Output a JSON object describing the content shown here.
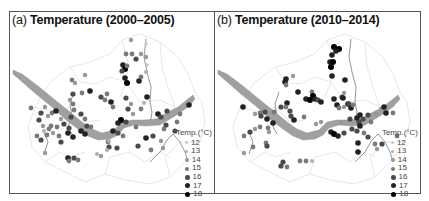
{
  "figure": {
    "panels": [
      {
        "id": "a",
        "tag": "(a)",
        "title": "Temperature (2000–2005)",
        "legend_title": "Temp.(°C)"
      },
      {
        "id": "b",
        "tag": "(b)",
        "title": "Temperature (2010–2014)",
        "legend_title": "Temp.(°C)"
      }
    ],
    "legend_levels": [
      {
        "label": "12",
        "color": "#c8c8c8",
        "size": 3
      },
      {
        "label": "13",
        "color": "#b0b0b0",
        "size": 3.4
      },
      {
        "label": "14",
        "color": "#989898",
        "size": 3.8
      },
      {
        "label": "15",
        "color": "#7a7a7a",
        "size": 4.2
      },
      {
        "label": "16",
        "color": "#4a4a4a",
        "size": 4.6
      },
      {
        "label": "17",
        "color": "#222222",
        "size": 5
      },
      {
        "label": "18",
        "color": "#000000",
        "size": 5.4
      }
    ]
  },
  "chart_data": [
    {
      "type": "scatter",
      "title": "(a) Temperature (2000–2005)",
      "legend": {
        "title": "Temp.(°C)",
        "entries": [
          "12",
          "13",
          "14",
          "15",
          "16",
          "17",
          "18"
        ],
        "position": "bottom-right"
      },
      "points": [
        [
          130,
          39,
          14
        ],
        [
          145,
          43,
          12
        ],
        [
          125,
          53,
          15
        ],
        [
          131,
          53,
          15
        ],
        [
          135,
          58,
          16
        ],
        [
          140,
          53,
          14
        ],
        [
          145,
          56,
          14
        ],
        [
          146,
          64,
          12
        ],
        [
          122,
          64,
          17
        ],
        [
          124,
          68,
          18
        ],
        [
          121,
          70,
          16
        ],
        [
          126,
          65,
          15
        ],
        [
          124,
          77,
          17
        ],
        [
          126,
          82,
          18
        ],
        [
          138,
          80,
          17
        ],
        [
          140,
          76,
          15
        ],
        [
          145,
          71,
          13
        ],
        [
          71,
          79,
          15
        ],
        [
          74,
          82,
          14
        ],
        [
          84,
          74,
          14
        ],
        [
          72,
          93,
          16
        ],
        [
          81,
          92,
          15
        ],
        [
          89,
          90,
          17
        ],
        [
          72,
          103,
          15
        ],
        [
          69,
          99,
          14
        ],
        [
          73,
          109,
          15
        ],
        [
          100,
          96,
          16
        ],
        [
          104,
          99,
          15
        ],
        [
          106,
          93,
          15
        ],
        [
          110,
          101,
          17
        ],
        [
          112,
          106,
          15
        ],
        [
          125,
          97,
          16
        ],
        [
          127,
          108,
          16
        ],
        [
          130,
          103,
          14
        ],
        [
          140,
          108,
          15
        ],
        [
          146,
          96,
          17
        ],
        [
          143,
          102,
          13
        ],
        [
          132,
          113,
          14
        ],
        [
          157,
          113,
          17
        ],
        [
          160,
          116,
          16
        ],
        [
          166,
          110,
          16
        ],
        [
          179,
          113,
          15
        ],
        [
          188,
          104,
          17
        ],
        [
          30,
          107,
          15
        ],
        [
          40,
          112,
          16
        ],
        [
          44,
          106,
          14
        ],
        [
          47,
          115,
          14
        ],
        [
          51,
          112,
          15
        ],
        [
          55,
          110,
          17
        ],
        [
          60,
          118,
          14
        ],
        [
          38,
          119,
          16
        ],
        [
          42,
          125,
          14
        ],
        [
          50,
          125,
          15
        ],
        [
          56,
          126,
          15
        ],
        [
          63,
          123,
          16
        ],
        [
          70,
          116,
          16
        ],
        [
          80,
          113,
          16
        ],
        [
          84,
          118,
          15
        ],
        [
          120,
          119,
          18
        ],
        [
          117,
          122,
          17
        ],
        [
          125,
          121,
          16
        ],
        [
          135,
          126,
          15
        ],
        [
          112,
          130,
          17
        ],
        [
          122,
          135,
          15
        ],
        [
          117,
          132,
          16
        ],
        [
          43,
          130,
          13
        ],
        [
          46,
          134,
          15
        ],
        [
          52,
          132,
          14
        ],
        [
          40,
          139,
          16
        ],
        [
          36,
          135,
          15
        ],
        [
          48,
          128,
          15
        ],
        [
          58,
          135,
          15
        ],
        [
          60,
          141,
          16
        ],
        [
          67,
          132,
          17
        ],
        [
          68,
          127,
          16
        ],
        [
          72,
          136,
          17
        ],
        [
          80,
          130,
          17
        ],
        [
          86,
          125,
          16
        ],
        [
          90,
          126,
          15
        ],
        [
          84,
          133,
          17
        ],
        [
          107,
          141,
          15
        ],
        [
          108,
          146,
          16
        ],
        [
          108,
          140,
          13
        ],
        [
          116,
          147,
          16
        ],
        [
          137,
          145,
          16
        ],
        [
          145,
          137,
          17
        ],
        [
          152,
          135,
          16
        ],
        [
          160,
          140,
          14
        ],
        [
          163,
          128,
          15
        ],
        [
          174,
          130,
          16
        ],
        [
          165,
          124,
          16
        ],
        [
          176,
          121,
          15
        ],
        [
          162,
          147,
          14
        ],
        [
          150,
          149,
          15
        ],
        [
          44,
          152,
          14
        ],
        [
          67,
          157,
          17
        ],
        [
          73,
          157,
          16
        ],
        [
          68,
          160,
          15
        ],
        [
          77,
          159,
          15
        ],
        [
          96,
          153,
          13
        ],
        [
          100,
          155,
          14
        ],
        [
          106,
          149,
          13
        ]
      ]
    },
    {
      "type": "scatter",
      "title": "(b) Temperature (2010–2014)",
      "legend": {
        "title": "Temp.(°C)",
        "entries": [
          "12",
          "13",
          "14",
          "15",
          "16",
          "17",
          "18"
        ],
        "position": "bottom-right"
      },
      "points": [
        [
          333,
          46,
          18
        ],
        [
          338,
          48,
          18
        ],
        [
          335,
          50,
          17
        ],
        [
          331,
          54,
          17
        ],
        [
          329,
          61,
          17
        ],
        [
          332,
          61,
          18
        ],
        [
          330,
          66,
          18
        ],
        [
          331,
          75,
          17
        ],
        [
          344,
          79,
          17
        ],
        [
          341,
          96,
          16
        ],
        [
          343,
          92,
          14
        ],
        [
          342,
          97,
          17
        ],
        [
          347,
          103,
          17
        ],
        [
          285,
          78,
          17
        ],
        [
          284,
          81,
          17
        ],
        [
          285,
          84,
          15
        ],
        [
          292,
          75,
          14
        ],
        [
          297,
          91,
          17
        ],
        [
          311,
          91,
          15
        ],
        [
          305,
          98,
          17
        ],
        [
          309,
          99,
          18
        ],
        [
          312,
          95,
          18
        ],
        [
          314,
          98,
          17
        ],
        [
          317,
          99,
          16
        ],
        [
          320,
          101,
          17
        ],
        [
          333,
          98,
          17
        ],
        [
          336,
          104,
          17
        ],
        [
          338,
          107,
          15
        ],
        [
          343,
          106,
          14
        ],
        [
          348,
          103,
          16
        ],
        [
          350,
          107,
          17
        ],
        [
          352,
          104,
          15
        ],
        [
          273,
          111,
          15
        ],
        [
          280,
          106,
          16
        ],
        [
          286,
          102,
          17
        ],
        [
          289,
          110,
          16
        ],
        [
          290,
          115,
          16
        ],
        [
          293,
          119,
          17
        ],
        [
          303,
          116,
          15
        ],
        [
          242,
          106,
          17
        ],
        [
          254,
          113,
          14
        ],
        [
          259,
          112,
          15
        ],
        [
          260,
          115,
          16
        ],
        [
          264,
          111,
          16
        ],
        [
          266,
          118,
          17
        ],
        [
          272,
          122,
          17
        ],
        [
          285,
          106,
          15
        ],
        [
          359,
          114,
          17
        ],
        [
          356,
          117,
          17
        ],
        [
          349,
          118,
          16
        ],
        [
          358,
          121,
          16
        ],
        [
          362,
          118,
          16
        ],
        [
          370,
          121,
          15
        ],
        [
          375,
          113,
          14
        ],
        [
          380,
          108,
          14
        ],
        [
          383,
          106,
          17
        ],
        [
          385,
          112,
          17
        ],
        [
          392,
          112,
          15
        ],
        [
          367,
          114,
          16
        ],
        [
          359,
          125,
          17
        ],
        [
          351,
          128,
          16
        ],
        [
          356,
          130,
          16
        ],
        [
          343,
          132,
          16
        ],
        [
          330,
          131,
          17
        ],
        [
          333,
          133,
          18
        ],
        [
          337,
          135,
          17
        ],
        [
          340,
          122,
          14
        ],
        [
          320,
          121,
          14
        ],
        [
          315,
          123,
          14
        ],
        [
          367,
          136,
          16
        ],
        [
          363,
          132,
          15
        ],
        [
          243,
          135,
          15
        ],
        [
          254,
          128,
          14
        ],
        [
          249,
          131,
          16
        ],
        [
          259,
          126,
          15
        ],
        [
          267,
          127,
          15
        ],
        [
          268,
          131,
          14
        ],
        [
          243,
          152,
          14
        ],
        [
          252,
          146,
          15
        ],
        [
          265,
          142,
          15
        ],
        [
          266,
          145,
          16
        ],
        [
          280,
          165,
          16
        ],
        [
          282,
          161,
          16
        ],
        [
          286,
          166,
          15
        ],
        [
          299,
          160,
          15
        ],
        [
          305,
          160,
          15
        ],
        [
          311,
          160,
          13
        ],
        [
          357,
          142,
          17
        ],
        [
          357,
          151,
          17
        ],
        [
          374,
          143,
          15
        ],
        [
          381,
          143,
          16
        ],
        [
          376,
          148,
          14
        ],
        [
          396,
          135,
          15
        ]
      ]
    }
  ]
}
